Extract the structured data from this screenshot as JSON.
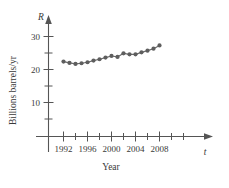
{
  "chart_data": {
    "type": "line",
    "title": "",
    "subtitle": "",
    "xlabel": "Year",
    "ylabel": "Billions barrels/yr",
    "x_axis_variable": "t",
    "y_axis_variable": "R",
    "x": [
      1992,
      1993,
      1994,
      1995,
      1996,
      1997,
      1998,
      1999,
      2000,
      2001,
      2002,
      2003,
      2004,
      2005,
      2006,
      2007,
      2008
    ],
    "values": [
      22.4,
      22.0,
      21.7,
      21.9,
      22.2,
      22.7,
      23.1,
      23.6,
      24.1,
      23.8,
      24.9,
      24.6,
      24.6,
      25.2,
      25.7,
      26.3,
      27.3
    ],
    "series": [
      {
        "name": "Billions barrels/yr",
        "values": [
          22.4,
          22.0,
          21.7,
          21.9,
          22.2,
          22.7,
          23.1,
          23.6,
          24.1,
          23.8,
          24.9,
          24.6,
          24.6,
          25.2,
          25.7,
          26.3,
          27.3
        ]
      }
    ],
    "xlim": [
      1991,
      2009.5
    ],
    "ylim": [
      0,
      32
    ],
    "x_major_ticks": [
      1992,
      1996,
      2000,
      2004,
      2008
    ],
    "x_minor_ticks": [
      1994,
      1998,
      2002,
      2006
    ],
    "x_tick_labels": [
      "1992",
      "1996",
      "2000",
      "2004",
      "2008"
    ],
    "y_major_ticks": [
      10,
      20,
      30
    ],
    "y_minor_ticks": [
      5,
      15,
      25
    ],
    "y_tick_labels": [
      "10",
      "20",
      "30"
    ],
    "grid": false,
    "legend": "none",
    "marker": "filled-circle",
    "line_color": "#6b6b6b",
    "marker_color": "#5e5e5e",
    "axis_color": "#555555"
  },
  "labels": {
    "x_axis_title": "Year",
    "y_axis_title": "Billions barrels/yr",
    "x_axis_variable": "t",
    "y_axis_variable": "R"
  }
}
